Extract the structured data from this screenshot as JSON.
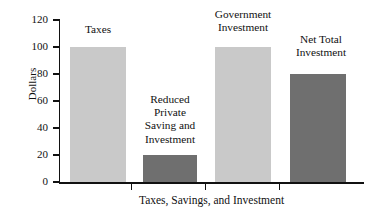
{
  "chart_data": {
    "type": "bar",
    "title": "",
    "xlabel": "Taxes, Savings, and Investment",
    "ylabel": "Dollars",
    "ylim": [
      0,
      120
    ],
    "grid": false,
    "legend": "none",
    "categories": [
      "Taxes",
      "Reduced Private Saving and Investment",
      "Government Investment",
      "Net Total Investment"
    ],
    "values": [
      100,
      20,
      100,
      80
    ],
    "y_ticks": [
      "0",
      "20",
      "40",
      "60",
      "80",
      "100",
      "120"
    ],
    "bar_colors": [
      "#c9c9c9",
      "#6f6f6f",
      "#c9c9c9",
      "#6f6f6f"
    ],
    "bars": [
      {
        "label": "Taxes",
        "value": 100,
        "color": "#c9c9c9",
        "caption": "Taxes"
      },
      {
        "label": "Reduced Private Saving and Investment",
        "value": 20,
        "color": "#6f6f6f",
        "caption": "Reduced\nPrivate\nSaving and\nInvestment"
      },
      {
        "label": "Government Investment",
        "value": 100,
        "color": "#c9c9c9",
        "caption": "Government\nInvestment"
      },
      {
        "label": "Net Total Investment",
        "value": 80,
        "color": "#6f6f6f",
        "caption": "Net Total\nInvestment"
      }
    ]
  },
  "axes": {
    "y_title": "Dollars",
    "x_title": "Taxes, Savings, and Investment",
    "y_tick_labels": [
      "120",
      "100",
      "80",
      "60",
      "40",
      "20",
      "0"
    ]
  },
  "colors": {
    "axis": "#111111",
    "text": "#111111",
    "bar_light": "#c9c9c9",
    "bar_dark": "#6f6f6f",
    "background": "#ffffff"
  }
}
